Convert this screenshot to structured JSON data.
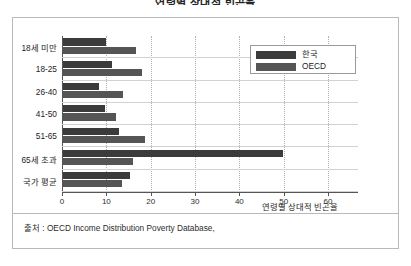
{
  "chart_data": {
    "type": "bar",
    "orientation": "horizontal",
    "title": "연령별 상대적 빈곤율",
    "xlabel": "연령별 상대적 빈곤율",
    "ylabel": "",
    "xlim": [
      0,
      60
    ],
    "xticks": [
      0,
      10,
      20,
      30,
      40,
      50,
      60
    ],
    "xtick_labels": [
      "0",
      "10",
      "20",
      "30",
      "40",
      "50",
      "60"
    ],
    "grid": true,
    "legend_position": "top-right",
    "categories": [
      "18세 미만",
      "18-25",
      "26-40",
      "41-50",
      "51-65",
      "65세 초과",
      "국가 평균"
    ],
    "series": [
      {
        "name": "한국",
        "color": "#3b3b3b",
        "values": [
          9.8,
          11.0,
          8.1,
          9.4,
          12.6,
          49.6,
          15.0
        ]
      },
      {
        "name": "OECD",
        "color": "#555555",
        "values": [
          16.4,
          17.8,
          13.5,
          11.9,
          18.4,
          15.9,
          13.3
        ]
      }
    ],
    "source": "출처 : OECD Income Distribution Poverty Database,"
  },
  "legend": {
    "entries": [
      {
        "label": "한국"
      },
      {
        "label": "OECD"
      }
    ]
  },
  "footer": {
    "source": "출처 : OECD Income Distribution Poverty Database,"
  }
}
